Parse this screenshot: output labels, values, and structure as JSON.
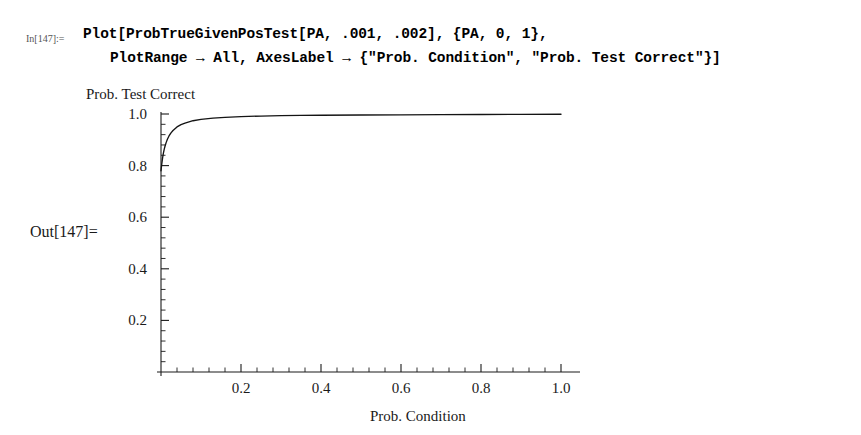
{
  "notebook": {
    "in_label": "In[147]:=",
    "out_label": "Out[147]=",
    "code_lines": [
      "Plot[ProbTrueGivenPosTest[PA, .001, .002], {PA, 0, 1},",
      "PlotRange → All, AxesLabel → {\"Prob. Condition\", \"Prob. Test Correct\"}]"
    ]
  },
  "chart_data": {
    "type": "line",
    "title": "",
    "xlabel": "Prob. Condition",
    "ylabel": "Prob. Test Correct",
    "xlim": [
      0,
      1.04
    ],
    "ylim": [
      0,
      1.0
    ],
    "grid": false,
    "legend": null,
    "x_ticks": [
      {
        "value": 0.2,
        "label": "0.2"
      },
      {
        "value": 0.4,
        "label": "0.4"
      },
      {
        "value": 0.6,
        "label": "0.6"
      },
      {
        "value": 0.8,
        "label": "0.8"
      },
      {
        "value": 1.0,
        "label": "1.0"
      }
    ],
    "y_ticks": [
      {
        "value": 0.2,
        "label": "0.2"
      },
      {
        "value": 0.4,
        "label": "0.4"
      },
      {
        "value": 0.6,
        "label": "0.6"
      },
      {
        "value": 0.8,
        "label": "0.8"
      },
      {
        "value": 1.0,
        "label": "1.0"
      }
    ],
    "x_minor_per_interval": 4,
    "y_minor_per_interval": 4,
    "series": [
      {
        "name": "ProbTrueGivenPosTest[PA, .001, .002]",
        "color": "#141414",
        "x": [
          0.0,
          0.002,
          0.004,
          0.006,
          0.008,
          0.01,
          0.013,
          0.016,
          0.02,
          0.025,
          0.03,
          0.04,
          0.05,
          0.06,
          0.08,
          0.1,
          0.13,
          0.16,
          0.2,
          0.25,
          0.3,
          0.35,
          0.4,
          0.5,
          0.6,
          0.7,
          0.8,
          0.9,
          1.0
        ],
        "y": [
          0.78,
          0.807,
          0.83,
          0.848,
          0.863,
          0.875,
          0.89,
          0.902,
          0.915,
          0.927,
          0.936,
          0.95,
          0.959,
          0.965,
          0.974,
          0.979,
          0.984,
          0.987,
          0.99,
          0.992,
          0.9935,
          0.9945,
          0.995,
          0.996,
          0.9968,
          0.9974,
          0.998,
          0.9986,
          0.999
        ]
      }
    ]
  },
  "plot_geometry": {
    "origin_x": 161,
    "origin_y": 372,
    "x_axis_end": 580,
    "y_axis_top": 112,
    "x_unit_px": 400,
    "y_unit_px": 258
  }
}
